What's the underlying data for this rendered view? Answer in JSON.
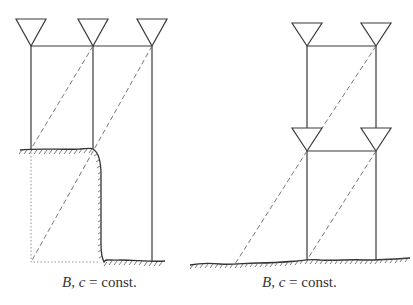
{
  "figure": {
    "panels": [
      {
        "id": "left",
        "description": "Three antenna masts on stepped terrain (cliff) with dashed ray paths",
        "caption": {
          "var": "B, c",
          "rest": " = const."
        },
        "antenna_count": 3
      },
      {
        "id": "right",
        "description": "Two-level stacked antenna array on flat terrain with dashed ray paths",
        "caption": {
          "var": "B, c",
          "rest": " = const."
        },
        "antenna_count": 4
      }
    ],
    "colors": {
      "line": "#3a3a3a",
      "dashed": "#6a6a6a",
      "dotted": "#8a8a8a",
      "hatch": "#5a5a5a",
      "text": "#333333"
    }
  }
}
